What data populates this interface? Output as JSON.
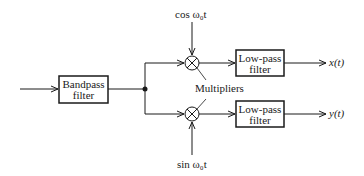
{
  "diagram": {
    "type": "block-diagram",
    "blocks": {
      "bandpass": {
        "line1": "Bandpass",
        "line2": "filter"
      },
      "lowpass_top": {
        "line1": "Low-pass",
        "line2": "filter"
      },
      "lowpass_bottom": {
        "line1": "Low-pass",
        "line2": "filter"
      }
    },
    "labels": {
      "cos_input": "cos ω₀t",
      "sin_input": "sin ω₀t",
      "multipliers": "Multipliers",
      "output_top": "x(t)",
      "output_bottom": "y(t)"
    },
    "symbols": {
      "multiplier": "⊗"
    },
    "colors": {
      "stroke": "#1a1a1a",
      "background": "#ffffff"
    }
  }
}
